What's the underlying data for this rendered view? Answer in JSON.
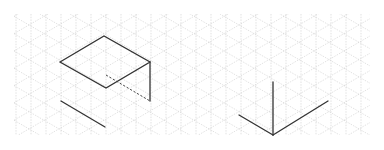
{
  "diagram": {
    "type": "isometric-grid-drawing",
    "canvas": {
      "width": 384,
      "height": 150,
      "background": "#ffffff"
    },
    "grid": {
      "x0": 14,
      "y0": 14,
      "x1": 370,
      "y1": 135,
      "spacing_x": 15,
      "angle_deg": 30,
      "color": "#cfcfcf",
      "style": "dotted"
    },
    "colors": {
      "line": "#333333",
      "hidden": "#444444"
    },
    "figures": [
      {
        "id": "open-box-top-face",
        "kind": "polygon",
        "points": [
          [
            60,
            62
          ],
          [
            104,
            36
          ],
          [
            150,
            62
          ],
          [
            106,
            88
          ]
        ]
      },
      {
        "id": "open-box-vertical-edge",
        "kind": "line",
        "points": [
          [
            150,
            62
          ],
          [
            150,
            101
          ]
        ]
      },
      {
        "id": "open-box-hidden-edge",
        "kind": "dashed-line",
        "points": [
          [
            106,
            75
          ],
          [
            150,
            101
          ]
        ]
      },
      {
        "id": "bottom-left-segment",
        "kind": "line",
        "points": [
          [
            61,
            101
          ],
          [
            105,
            127
          ]
        ]
      },
      {
        "id": "iso-axes-vertical",
        "kind": "line",
        "points": [
          [
            273,
            135
          ],
          [
            273,
            82
          ]
        ]
      },
      {
        "id": "iso-axes-left",
        "kind": "line",
        "points": [
          [
            273,
            135
          ],
          [
            239,
            115
          ]
        ]
      },
      {
        "id": "iso-axes-right",
        "kind": "line",
        "points": [
          [
            273,
            135
          ],
          [
            328,
            101
          ]
        ]
      }
    ]
  }
}
